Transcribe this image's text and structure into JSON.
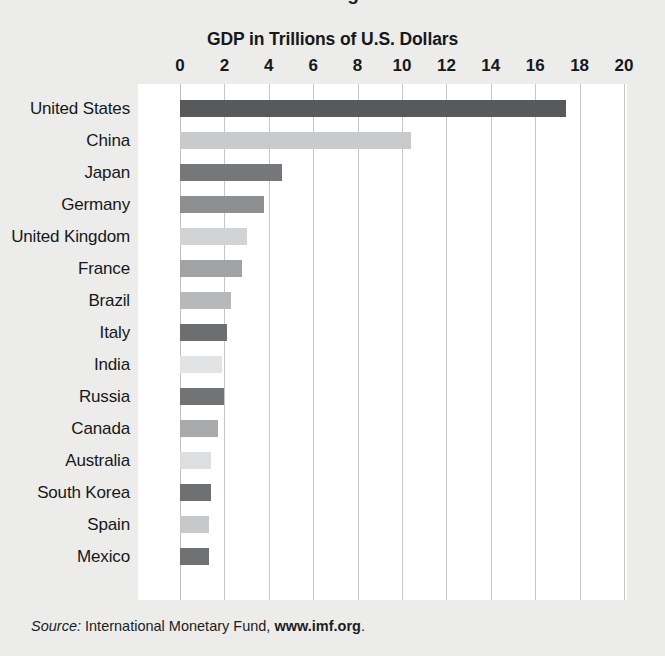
{
  "clipped_title": "…at Exchange Rates",
  "axis_title": "GDP in Trillions of U.S. Dollars",
  "source": {
    "label": "Source:",
    "body": "International Monetary Fund,",
    "url": "www.imf.org",
    "period": "."
  },
  "chart_data": {
    "type": "bar",
    "orientation": "horizontal",
    "title": "GDP in Trillions of U.S. Dollars",
    "xlabel": "GDP in Trillions of U.S. Dollars",
    "ylabel": "",
    "xlim": [
      0,
      20
    ],
    "xticks": [
      0,
      2,
      4,
      6,
      8,
      10,
      12,
      14,
      16,
      18,
      20
    ],
    "xtick_labels": [
      "0",
      "2",
      "4",
      "6",
      "8",
      "10",
      "12",
      "14",
      "16",
      "18",
      "20"
    ],
    "grid": "vertical",
    "legend": "none",
    "units": "Trillions of U.S. Dollars",
    "categories": [
      "United States",
      "China",
      "Japan",
      "Germany",
      "United Kingdom",
      "France",
      "Brazil",
      "Italy",
      "India",
      "Russia",
      "Canada",
      "Australia",
      "South Korea",
      "Spain",
      "Mexico"
    ],
    "values": [
      17.4,
      10.4,
      4.6,
      3.8,
      3.0,
      2.8,
      2.3,
      2.1,
      1.9,
      2.0,
      1.7,
      1.4,
      1.4,
      1.3,
      1.3
    ],
    "bar_colors": [
      "#58595b",
      "#c9cacb",
      "#76777a",
      "#8d8f91",
      "#d2d3d4",
      "#a0a2a4",
      "#b6b8b9",
      "#6d6e71",
      "#e2e3e4",
      "#717375",
      "#a8aaac",
      "#dddedf",
      "#6e7073",
      "#c7c8ca",
      "#6f7174"
    ],
    "bars": [
      {
        "category": "United States",
        "value": 17.4,
        "color": "#58595b"
      },
      {
        "category": "China",
        "value": 10.4,
        "color": "#c9cacb"
      },
      {
        "category": "Japan",
        "value": 4.6,
        "color": "#76777a"
      },
      {
        "category": "Germany",
        "value": 3.8,
        "color": "#8d8f91"
      },
      {
        "category": "United Kingdom",
        "value": 3.0,
        "color": "#d2d3d4"
      },
      {
        "category": "France",
        "value": 2.8,
        "color": "#a0a2a4"
      },
      {
        "category": "Brazil",
        "value": 2.3,
        "color": "#b6b8b9"
      },
      {
        "category": "Italy",
        "value": 2.1,
        "color": "#6d6e71"
      },
      {
        "category": "India",
        "value": 1.9,
        "color": "#e2e3e4"
      },
      {
        "category": "Russia",
        "value": 2.0,
        "color": "#717375"
      },
      {
        "category": "Canada",
        "value": 1.7,
        "color": "#a8aaac"
      },
      {
        "category": "Australia",
        "value": 1.4,
        "color": "#dddedf"
      },
      {
        "category": "South Korea",
        "value": 1.4,
        "color": "#6e7073"
      },
      {
        "category": "Spain",
        "value": 1.3,
        "color": "#c7c8ca"
      },
      {
        "category": "Mexico",
        "value": 1.3,
        "color": "#6f7174"
      }
    ]
  }
}
